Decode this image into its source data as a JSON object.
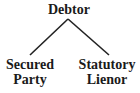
{
  "diagram": {
    "type": "tree",
    "root": {
      "label": "Debtor"
    },
    "children": [
      {
        "label_line1": "Secured",
        "label_line2": "Party"
      },
      {
        "label_line1": "Statutory",
        "label_line2": "Lienor"
      }
    ],
    "colors": {
      "text": "#1a1a1a",
      "line": "#222222",
      "background": "#ffffff"
    }
  }
}
